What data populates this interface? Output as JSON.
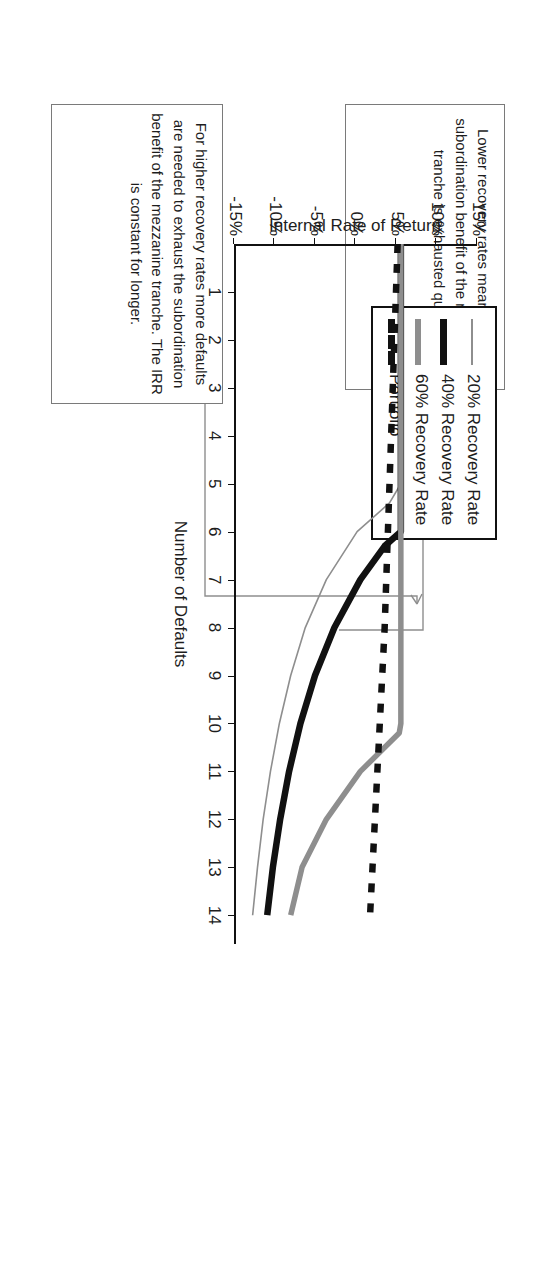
{
  "figure": {
    "axis_x_title": "Number of Defaults",
    "axis_y_title": "Internal Rate of Return"
  },
  "legend": {
    "items": [
      {
        "label": "20% Recovery Rate",
        "style": "thin-gray",
        "color": "#8e8e8e"
      },
      {
        "label": "40% Recovery Rate",
        "style": "thick-black",
        "color": "#111111"
      },
      {
        "label": "60% Recovery Rate",
        "style": "thick-gray",
        "color": "#8e8e8e"
      },
      {
        "label": "Portfolio",
        "style": "dashed-black",
        "color": "#111111"
      }
    ]
  },
  "annotations": [
    {
      "id": "note-higher-recovery",
      "text": "For higher recovery rates more defaults are needed to exhaust the subordination benefit of the mezzanine tranche. The IRR is constant for longer."
    },
    {
      "id": "note-lower-recovery",
      "text": "Lower recovery rates mean that the subordination benefit of the mezzanine tranche is exhausted quicker."
    }
  ],
  "chart_data": {
    "type": "line",
    "title": "",
    "xlabel": "Number of Defaults",
    "ylabel": "Internal Rate of Return",
    "xlim": [
      0,
      14.6
    ],
    "ylim": [
      -15,
      15
    ],
    "xticks": [
      1,
      2,
      3,
      4,
      5,
      6,
      7,
      8,
      9,
      10,
      11,
      12,
      13,
      14
    ],
    "ytick_labels": [
      "15%",
      "10%",
      "5%",
      "0%",
      "-5%",
      "-10%",
      "-15%"
    ],
    "yticks": [
      15,
      10,
      5,
      0,
      -5,
      -10,
      -15
    ],
    "grid": false,
    "legend_position": "top-left",
    "series": [
      {
        "name": "20% Recovery Rate",
        "style": "thin-gray",
        "color": "#8e8e8e",
        "x": [
          0,
          1,
          2,
          3,
          4,
          5,
          5.4,
          6,
          7,
          8,
          9,
          10,
          11,
          12,
          13,
          14
        ],
        "values": [
          5.6,
          5.6,
          5.6,
          5.6,
          5.6,
          5.6,
          4.2,
          0.2,
          -3.6,
          -6.2,
          -8.0,
          -9.4,
          -10.5,
          -11.4,
          -12.1,
          -12.7
        ]
      },
      {
        "name": "40% Recovery Rate",
        "style": "thick-black",
        "color": "#111111",
        "x": [
          0,
          1,
          2,
          3,
          4,
          5,
          6,
          6.3,
          7,
          8,
          9,
          10,
          11,
          12,
          13,
          14
        ],
        "values": [
          5.6,
          5.6,
          5.6,
          5.6,
          5.6,
          5.6,
          5.6,
          3.6,
          0.6,
          -2.6,
          -5.0,
          -6.8,
          -8.2,
          -9.3,
          -10.2,
          -10.9
        ]
      },
      {
        "name": "60% Recovery Rate",
        "style": "thick-gray",
        "color": "#8e8e8e",
        "x": [
          0,
          1,
          2,
          3,
          4,
          5,
          6,
          7,
          8,
          9,
          10,
          10.2,
          11,
          12,
          13,
          14
        ],
        "values": [
          5.6,
          5.6,
          5.6,
          5.6,
          5.6,
          5.6,
          5.6,
          5.6,
          5.6,
          5.6,
          5.6,
          5.4,
          0.6,
          -3.6,
          -6.6,
          -8.0
        ]
      },
      {
        "name": "Portfolio",
        "style": "dashed-black",
        "color": "#111111",
        "x": [
          0,
          1,
          2,
          3,
          4,
          5,
          6,
          7,
          8,
          9,
          10,
          11,
          12,
          13,
          14
        ],
        "values": [
          5.2,
          5.0,
          4.8,
          4.6,
          4.4,
          4.2,
          4.0,
          3.8,
          3.6,
          3.3,
          3.0,
          2.7,
          2.4,
          2.1,
          1.8
        ]
      }
    ]
  }
}
